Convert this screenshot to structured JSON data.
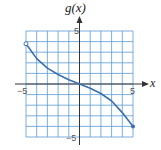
{
  "chart_data": {
    "type": "line",
    "title": "g(x)",
    "xlabel": "x",
    "ylabel": "g(x)",
    "xlim": [
      -5,
      5
    ],
    "ylim": [
      -5,
      5
    ],
    "grid": true,
    "x_ticks": [
      "-5",
      "5"
    ],
    "y_ticks": [
      "5",
      "-5"
    ],
    "series": [
      {
        "name": "g(x)",
        "x": [
          -5,
          -4,
          -3,
          -2,
          -1,
          0,
          1,
          2,
          3,
          4,
          5
        ],
        "y": [
          3.8,
          2.4,
          1.5,
          0.9,
          0.4,
          0,
          -0.4,
          -0.9,
          -1.6,
          -2.7,
          -4
        ],
        "start_point": {
          "x": -5,
          "y": 3.8,
          "style": "open"
        },
        "end_point": {
          "x": 5,
          "y": -4,
          "style": "closed"
        }
      }
    ]
  },
  "labels": {
    "title": "g(x)",
    "x_axis": "x",
    "x_min": "−5",
    "x_max": "5",
    "y_max": "5",
    "y_min": "−5"
  },
  "colors": {
    "grid": "#5b9bd5",
    "curve": "#3a6fb0",
    "axis": "#333333"
  }
}
